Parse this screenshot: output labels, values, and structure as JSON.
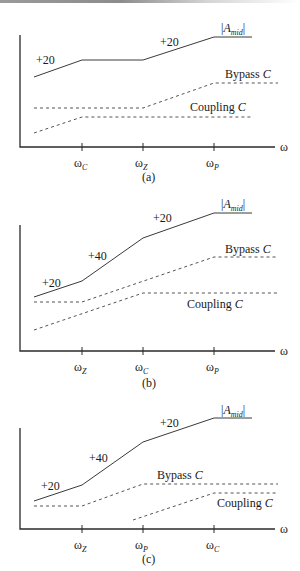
{
  "chart_data": [
    {
      "type": "line",
      "panel_label": "(a)",
      "title": "",
      "xlabel": "ω",
      "ylabel": "",
      "axis": {
        "x0": 20,
        "y0": 147,
        "x1": 275,
        "ytop": 35
      },
      "x_ticks": [
        {
          "x": 82,
          "label": "ω",
          "sub": "C"
        },
        {
          "x": 143,
          "label": "ω",
          "sub": "Z"
        },
        {
          "x": 214,
          "label": "ω",
          "sub": "P"
        }
      ],
      "series": [
        {
          "name": "|A_mid|",
          "style": "solid",
          "points": [
            [
              34,
              77
            ],
            [
              82,
              60
            ],
            [
              143,
              60
            ],
            [
              214,
              37
            ],
            [
              252,
              37
            ]
          ]
        },
        {
          "name": "Bypass C",
          "style": "dashed",
          "points": [
            [
              34,
              108
            ],
            [
              143,
              108
            ],
            [
              214,
              83
            ],
            [
              278,
              83
            ]
          ]
        },
        {
          "name": "Coupling C",
          "style": "dashed",
          "points": [
            [
              34,
              133
            ],
            [
              82,
              117
            ],
            [
              252,
              117
            ]
          ]
        }
      ],
      "annotations": [
        {
          "text": "+20",
          "x": 36,
          "y": 64
        },
        {
          "text": "+20",
          "x": 160,
          "y": 46
        }
      ],
      "labels": [
        {
          "text": "|A",
          "sub": "mid",
          "close": "|",
          "x": 221,
          "y": 32
        },
        {
          "text": "Bypass ",
          "ital": "C",
          "x": 225,
          "y": 78
        },
        {
          "text": "Coupling ",
          "ital": "C",
          "x": 190,
          "y": 111
        }
      ],
      "caption": {
        "text": "(a)",
        "x": 149,
        "y": 181
      }
    },
    {
      "type": "line",
      "panel_label": "(b)",
      "title": "",
      "xlabel": "ω",
      "ylabel": "",
      "axis": {
        "x0": 20,
        "y0": 351,
        "x1": 275,
        "ytop": 225
      },
      "x_ticks": [
        {
          "x": 82,
          "label": "ω",
          "sub": "Z"
        },
        {
          "x": 143,
          "label": "ω",
          "sub": "C"
        },
        {
          "x": 214,
          "label": "ω",
          "sub": "P"
        }
      ],
      "series": [
        {
          "name": "|A_mid|",
          "style": "solid",
          "points": [
            [
              34,
              297
            ],
            [
              82,
              281
            ],
            [
              143,
              238
            ],
            [
              214,
              213
            ],
            [
              252,
              213
            ]
          ]
        },
        {
          "name": "Bypass C",
          "style": "dashed",
          "points": [
            [
              34,
              302
            ],
            [
              82,
              302
            ],
            [
              214,
              257
            ],
            [
              278,
              257
            ]
          ]
        },
        {
          "name": "Coupling C",
          "style": "dashed",
          "points": [
            [
              34,
              330
            ],
            [
              143,
              293
            ],
            [
              278,
              293
            ]
          ]
        }
      ],
      "annotations": [
        {
          "text": "+20",
          "x": 42,
          "y": 287
        },
        {
          "text": "+40",
          "x": 88,
          "y": 260
        },
        {
          "text": "+20",
          "x": 153,
          "y": 222
        }
      ],
      "labels": [
        {
          "text": "|A",
          "sub": "mid",
          "close": "|",
          "x": 221,
          "y": 208
        },
        {
          "text": "Bypass ",
          "ital": "C",
          "x": 225,
          "y": 253
        },
        {
          "text": "Coupling ",
          "ital": "C",
          "x": 187,
          "y": 308
        }
      ],
      "caption": {
        "text": "(b)",
        "x": 149,
        "y": 387
      }
    },
    {
      "type": "line",
      "panel_label": "(c)",
      "title": "",
      "xlabel": "ω",
      "ylabel": "",
      "axis": {
        "x0": 20,
        "y0": 529,
        "x1": 275,
        "ytop": 428
      },
      "x_ticks": [
        {
          "x": 82,
          "label": "ω",
          "sub": "Z"
        },
        {
          "x": 143,
          "label": "ω",
          "sub": "P"
        },
        {
          "x": 214,
          "label": "ω",
          "sub": "C"
        }
      ],
      "series": [
        {
          "name": "|A_mid|",
          "style": "solid",
          "points": [
            [
              34,
              501
            ],
            [
              82,
              485
            ],
            [
              143,
              442
            ],
            [
              214,
              418
            ],
            [
              252,
              418
            ]
          ]
        },
        {
          "name": "Bypass C",
          "style": "dashed",
          "points": [
            [
              34,
              506
            ],
            [
              82,
              506
            ],
            [
              143,
              484
            ],
            [
              278,
              484
            ]
          ]
        },
        {
          "name": "Coupling C",
          "style": "dashed",
          "points": [
            [
              133,
              520
            ],
            [
              214,
              493
            ],
            [
              278,
              493
            ]
          ]
        }
      ],
      "annotations": [
        {
          "text": "+20",
          "x": 41,
          "y": 490
        },
        {
          "text": "+40",
          "x": 89,
          "y": 462
        },
        {
          "text": "+20",
          "x": 160,
          "y": 427
        }
      ],
      "labels": [
        {
          "text": "|A",
          "sub": "mid",
          "close": "|",
          "x": 221,
          "y": 414
        },
        {
          "text": "Bypass ",
          "ital": "C",
          "x": 157,
          "y": 479
        },
        {
          "text": "Coupling ",
          "ital": "C",
          "x": 217,
          "y": 507
        }
      ],
      "caption": {
        "text": "(c)",
        "x": 149,
        "y": 563
      }
    }
  ]
}
